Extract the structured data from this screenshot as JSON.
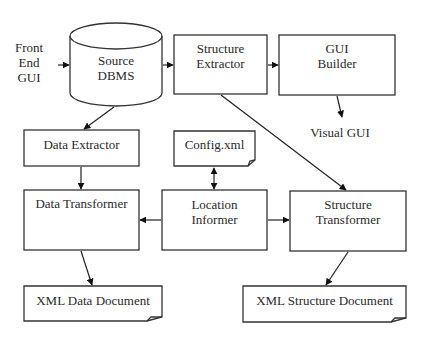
{
  "diagram": {
    "type": "flowchart",
    "nodes": {
      "front_end_gui": {
        "label_lines": [
          "Front",
          "End",
          "GUI"
        ],
        "shape": "text"
      },
      "source_dbms": {
        "label_lines": [
          "Source",
          "DBMS"
        ],
        "shape": "cylinder"
      },
      "structure_extractor": {
        "label_lines": [
          "Structure",
          "Extractor"
        ],
        "shape": "rectangle"
      },
      "gui_builder": {
        "label_lines": [
          "GUI",
          "Builder"
        ],
        "shape": "rectangle"
      },
      "visual_gui": {
        "label": "Visual GUI",
        "shape": "text"
      },
      "data_extractor": {
        "label": "Data Extractor",
        "shape": "rectangle"
      },
      "config_xml": {
        "label": "Config.xml",
        "shape": "document"
      },
      "data_transformer": {
        "label": "Data Transformer",
        "shape": "rectangle"
      },
      "location_informer": {
        "label_lines": [
          "Location",
          "Informer"
        ],
        "shape": "rectangle"
      },
      "structure_transformer": {
        "label_lines": [
          "Structure",
          "Transformer"
        ],
        "shape": "rectangle"
      },
      "xml_data_document": {
        "label": "XML Data Document",
        "shape": "document"
      },
      "xml_structure_document": {
        "label": "XML Structure Document",
        "shape": "document"
      }
    },
    "edges": [
      {
        "from": "front_end_gui",
        "to": "source_dbms"
      },
      {
        "from": "source_dbms",
        "to": "structure_extractor"
      },
      {
        "from": "structure_extractor",
        "to": "gui_builder"
      },
      {
        "from": "gui_builder",
        "to": "visual_gui"
      },
      {
        "from": "source_dbms",
        "to": "data_extractor"
      },
      {
        "from": "data_extractor",
        "to": "data_transformer"
      },
      {
        "from": "config_xml",
        "to": "location_informer",
        "bidirectional": true
      },
      {
        "from": "location_informer",
        "to": "data_transformer"
      },
      {
        "from": "location_informer",
        "to": "structure_transformer"
      },
      {
        "from": "structure_extractor",
        "to": "structure_transformer"
      },
      {
        "from": "data_transformer",
        "to": "xml_data_document"
      },
      {
        "from": "structure_transformer",
        "to": "xml_structure_document"
      }
    ],
    "colors": {
      "stroke": "#333333",
      "fill": "#ffffff",
      "text": "#2a2a2a"
    }
  }
}
